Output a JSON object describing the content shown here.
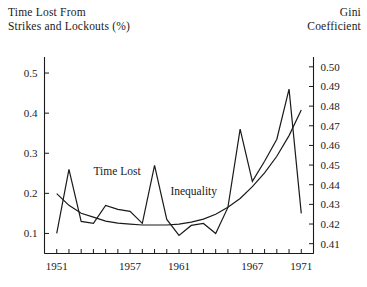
{
  "titles": {
    "left_axis": "Time Lost From\nStrikes and Lockouts (%)",
    "left_axis_line1": "Time Lost From",
    "left_axis_line2": "Strikes and Lockouts (%)",
    "right_axis_line1": "Gini",
    "right_axis_line2": "Coefficient"
  },
  "labels": {
    "time_lost": "Time Lost",
    "inequality": "Inequality"
  },
  "chart_data": {
    "type": "line",
    "title": "",
    "subtitle": "",
    "xlabel": "",
    "ylabel": "Time Lost From Strikes and Lockouts (%)",
    "y2label": "Gini Coefficient",
    "grid": false,
    "legend": "inline-annotations",
    "xlim": [
      1950,
      1972
    ],
    "xticks": [
      1950,
      1951,
      1952,
      1953,
      1954,
      1955,
      1956,
      1957,
      1958,
      1959,
      1960,
      1961,
      1962,
      1963,
      1964,
      1965,
      1966,
      1967,
      1968,
      1969,
      1970,
      1971,
      1972
    ],
    "xticklabels": [
      "",
      "1951",
      "",
      "",
      "",
      "",
      "",
      "1957",
      "",
      "",
      "",
      "1961",
      "",
      "",
      "",
      "",
      "",
      "1967",
      "",
      "",
      "",
      "1971",
      ""
    ],
    "xtick_labeled_values": [
      1951,
      1957,
      1961,
      1967,
      1971
    ],
    "ylim": [
      0.05,
      0.54
    ],
    "yticks": [
      0.1,
      0.2,
      0.3,
      0.4,
      0.5
    ],
    "yticklabels": [
      "0.1",
      "0.2",
      "0.3",
      "0.4",
      "0.5"
    ],
    "y2lim": [
      0.405,
      0.505
    ],
    "y2ticks": [
      0.41,
      0.42,
      0.43,
      0.44,
      0.45,
      0.46,
      0.47,
      0.48,
      0.49,
      0.5
    ],
    "y2ticklabels": [
      "0.41",
      "0.42",
      "0.43",
      "0.44",
      "0.45",
      "0.46",
      "0.47",
      "0.48",
      "0.49",
      "0.50"
    ],
    "x": [
      1951,
      1952,
      1953,
      1954,
      1955,
      1956,
      1957,
      1958,
      1959,
      1960,
      1961,
      1962,
      1963,
      1964,
      1965,
      1966,
      1967,
      1968,
      1969,
      1970,
      1971
    ],
    "series": [
      {
        "name": "Time Lost",
        "axis": "left",
        "units": "%",
        "values": [
          0.1,
          0.26,
          0.13,
          0.125,
          0.17,
          0.16,
          0.155,
          0.125,
          0.27,
          0.135,
          0.095,
          0.12,
          0.125,
          0.1,
          0.165,
          0.36,
          0.23,
          0.28,
          0.335,
          0.46,
          0.15
        ]
      },
      {
        "name": "Inequality",
        "axis": "right",
        "units": "Gini",
        "values": [
          0.4355,
          0.4295,
          0.4255,
          0.4235,
          0.4215,
          0.4205,
          0.42,
          0.4195,
          0.4195,
          0.4195,
          0.42,
          0.421,
          0.4225,
          0.425,
          0.4285,
          0.433,
          0.439,
          0.446,
          0.4545,
          0.465,
          0.478
        ]
      }
    ],
    "annotations": [
      {
        "text": "Time Lost",
        "x": 1954.0,
        "y": 0.245,
        "axis": "left"
      },
      {
        "text": "Inequality",
        "x": 1960.3,
        "y": 0.195,
        "axis": "left"
      }
    ]
  }
}
